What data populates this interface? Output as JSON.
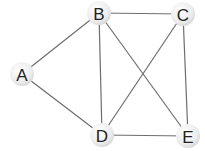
{
  "graph": {
    "nodes": [
      {
        "id": "A",
        "label": "A"
      },
      {
        "id": "B",
        "label": "B"
      },
      {
        "id": "C",
        "label": "C"
      },
      {
        "id": "D",
        "label": "D"
      },
      {
        "id": "E",
        "label": "E"
      }
    ],
    "edges": [
      [
        "A",
        "B"
      ],
      [
        "A",
        "D"
      ],
      [
        "B",
        "C"
      ],
      [
        "B",
        "D"
      ],
      [
        "B",
        "E"
      ],
      [
        "C",
        "D"
      ],
      [
        "C",
        "E"
      ],
      [
        "D",
        "E"
      ]
    ],
    "colors": {
      "edge": "#6e6e6e",
      "node_fill": "#ececec",
      "node_label": "#222222"
    }
  }
}
